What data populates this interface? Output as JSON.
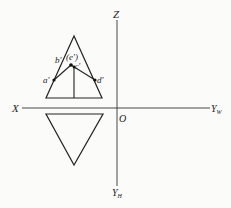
{
  "diagram": {
    "type": "orthographic-projection",
    "axes": {
      "z_label": "Z",
      "x_label": "X",
      "origin_label": "O",
      "yw_label": "Y",
      "yw_sub": "W",
      "yh_label": "Y",
      "yh_sub": "H"
    },
    "front_view": {
      "shape": "triangle",
      "points": {
        "a": "a'",
        "b": "b'",
        "c": "c'",
        "d": "d'",
        "e": "(e')"
      }
    },
    "top_view": {
      "shape": "inverted-triangle"
    },
    "colors": {
      "line": "#222222",
      "background": "#fbfbf9"
    }
  }
}
